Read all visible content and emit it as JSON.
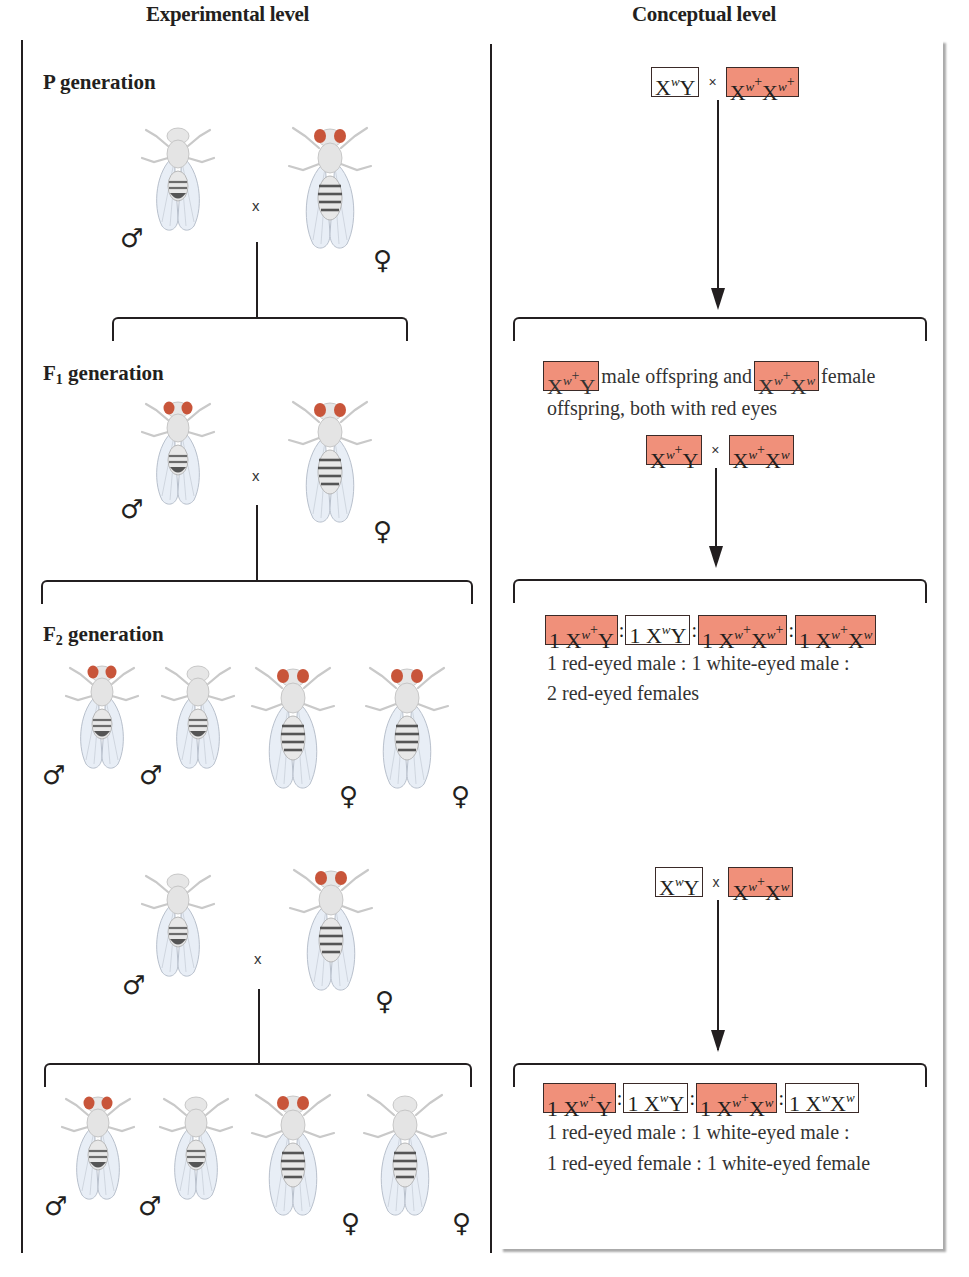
{
  "headers": {
    "experimental": "Experimental level",
    "conceptual": "Conceptual level"
  },
  "generations": {
    "p": {
      "label": "P",
      "suffix": "generation"
    },
    "f1": {
      "label": "F",
      "sub": "1",
      "suffix": "generation"
    },
    "f2": {
      "label": "F",
      "sub": "2",
      "suffix": "generation"
    }
  },
  "symbols": {
    "male": "♂",
    "female": "♀",
    "cross": "x"
  },
  "colors": {
    "red_eye": "#c8553a",
    "red_box": "#f0907a",
    "line": "#231f20"
  },
  "experimental": {
    "p_cross": [
      {
        "sex": "male",
        "eyes": "white"
      },
      {
        "sex": "female",
        "eyes": "red"
      }
    ],
    "f1_cross": [
      {
        "sex": "male",
        "eyes": "red"
      },
      {
        "sex": "female",
        "eyes": "red"
      }
    ],
    "f2_offspring": [
      {
        "sex": "male",
        "eyes": "red"
      },
      {
        "sex": "male",
        "eyes": "white"
      },
      {
        "sex": "female",
        "eyes": "red"
      },
      {
        "sex": "female",
        "eyes": "red"
      }
    ],
    "testcross": [
      {
        "sex": "male",
        "eyes": "white"
      },
      {
        "sex": "female",
        "eyes": "red"
      }
    ],
    "testcross_offspring": [
      {
        "sex": "male",
        "eyes": "red"
      },
      {
        "sex": "male",
        "eyes": "white"
      },
      {
        "sex": "female",
        "eyes": "red"
      },
      {
        "sex": "female",
        "eyes": "white"
      }
    ]
  },
  "conceptual": {
    "p_cross": {
      "left": {
        "base": "X",
        "sup": "w",
        "plus": false,
        "rest": "Y",
        "color": "white"
      },
      "cross": "×",
      "right": {
        "text": "Xw+Xw+",
        "color": "red"
      }
    },
    "f1_description": {
      "male_genotype": "Xw+Y",
      "text1": "male offspring and",
      "female_genotype": "Xw+Xw",
      "text2": "female",
      "line2": "offspring, both with red eyes"
    },
    "f1_cross": {
      "left": "Xw+Y",
      "cross": "×",
      "right": "Xw+Xw"
    },
    "f2_ratio": {
      "genotypes": [
        {
          "text": "1 Xw+Y",
          "color": "red"
        },
        {
          "text": "1 XwY",
          "color": "white"
        },
        {
          "text": "1 Xw+Xw+",
          "color": "red"
        },
        {
          "text": "1 Xw+Xw",
          "color": "red"
        }
      ],
      "line1": "1 red-eyed male : 1 white-eyed male :",
      "line2": "2 red-eyed females"
    },
    "testcross": {
      "left": "XwY",
      "cross": "x",
      "right": "Xw+Xw"
    },
    "testcross_ratio": {
      "genotypes": [
        {
          "text": "1 Xw+Y",
          "color": "red"
        },
        {
          "text": "1 XwY",
          "color": "white"
        },
        {
          "text": "1 Xw+Xw",
          "color": "red"
        },
        {
          "text": "1 XwXw",
          "color": "white"
        }
      ],
      "line1": "1 red-eyed male : 1 white-eyed male :",
      "line2": "1 red-eyed female : 1 white-eyed female"
    }
  }
}
